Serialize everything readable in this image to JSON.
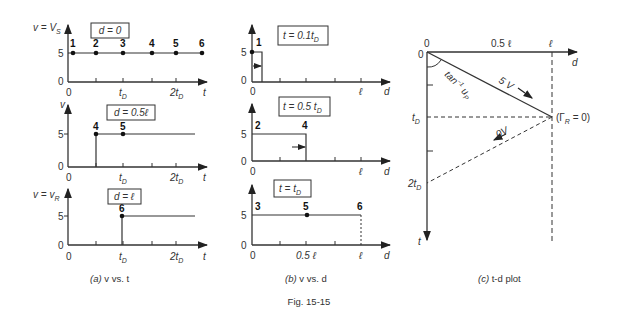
{
  "figure": {
    "caption": "Fig. 15-15",
    "panel_a": {
      "caption_prefix": "(a)",
      "caption_text": " v vs. t",
      "plots": [
        {
          "box": "d = 0",
          "ylabel": "v = V",
          "ylabel_sub": "S",
          "points": [
            "1",
            "2",
            "3",
            "4",
            "5",
            "6"
          ]
        },
        {
          "box": "d = 0.5ℓ",
          "ylabel": "v",
          "points": [
            "4",
            "5"
          ]
        },
        {
          "box": "d = ℓ",
          "ylabel": "v = v",
          "ylabel_sub": "R",
          "points": [
            "6"
          ]
        }
      ],
      "y_ticks": [
        "0",
        "5"
      ],
      "x_ticks": [
        "0",
        "t",
        "2t"
      ],
      "x_sub": "D",
      "x_axis": "t"
    },
    "panel_b": {
      "caption_prefix": "(b)",
      "caption_text": " v vs. d",
      "plots": [
        {
          "box": "t = 0.1t",
          "box_sub": "D",
          "points": [
            "1"
          ],
          "x_ticks": [
            "0",
            "ℓ"
          ]
        },
        {
          "box": "t = 0.5 t",
          "box_sub": "D",
          "points": [
            "2",
            "4"
          ],
          "x_ticks": [
            "0",
            "ℓ"
          ]
        },
        {
          "box": "t = t",
          "box_sub": "D",
          "points": [
            "3",
            "5",
            "6"
          ],
          "x_ticks": [
            "0",
            "0.5 ℓ",
            "ℓ"
          ]
        }
      ],
      "y_ticks": [
        "0",
        "5"
      ],
      "x_axis": "d"
    },
    "panel_c": {
      "caption_prefix": "(c)",
      "caption_text": " t-d plot",
      "top_labels": [
        "0",
        "0.5 ℓ",
        "ℓ"
      ],
      "left_labels": [
        "0",
        "t",
        "2t"
      ],
      "left_sub": "D",
      "d_axis": "d",
      "t_axis": "t",
      "forward_wave": "5 V",
      "reflected_wave": "0V",
      "angle_label": "tan",
      "angle_sup": "−1",
      "angle_var": " u",
      "angle_sub": "P",
      "reflection": "(Γ",
      "reflection_sub": "R",
      "reflection_end": " = 0)"
    }
  }
}
